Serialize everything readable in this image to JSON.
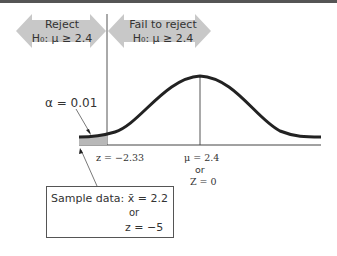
{
  "diagram": {
    "regions": {
      "reject": {
        "line1": "Reject",
        "line2": "H₀: μ ≥ 2.4"
      },
      "fail_to_reject": {
        "line1": "Fail to reject",
        "line2": "H₀: μ ≥ 2.4"
      }
    },
    "alpha_label": "α = 0.01",
    "critical_label": "z = −2.33",
    "mean_label": {
      "line1": "μ = 2.4",
      "line2": "or",
      "line3": "Z = 0"
    },
    "sample_box": {
      "line1": "Sample data: x̄ = 2.2",
      "line2": "or",
      "line3": "z = −5"
    },
    "colors": {
      "arrow_fill": "#c8c8c8",
      "curve": "#222222",
      "shaded_tail": "#b8b8b8",
      "top_bar": "#555555"
    }
  }
}
